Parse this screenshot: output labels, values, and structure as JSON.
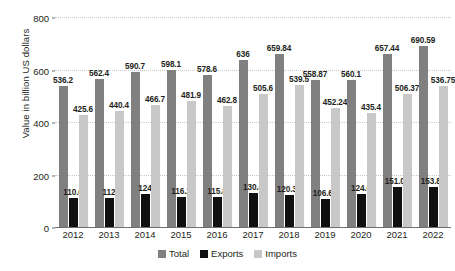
{
  "chart_data": {
    "type": "bar",
    "title": "",
    "subtitle": "",
    "xlabel": "",
    "ylabel": "Value in billion US dollars",
    "ylim": [
      0,
      800
    ],
    "yticks": [
      0,
      200,
      400,
      600,
      800
    ],
    "grid": true,
    "legend_position": "bottom",
    "categories": [
      "2012",
      "2013",
      "2014",
      "2015",
      "2016",
      "2017",
      "2018",
      "2019",
      "2020",
      "2021",
      "2022"
    ],
    "series": [
      {
        "name": "Total",
        "color": "#808080",
        "values": [
          536.2,
          562.4,
          590.7,
          598.1,
          578.6,
          636,
          659.84,
          558.87,
          560.1,
          657.44,
          690.59
        ],
        "labels": [
          "536.2",
          "562.4",
          "590.7",
          "598.1",
          "578.6",
          "636",
          "659.84",
          "558.87",
          "560.1",
          "657.44",
          "690.59"
        ]
      },
      {
        "name": "Exports",
        "color": "#101010",
        "values": [
          110.6,
          112,
          124,
          116.2,
          115.8,
          130.4,
          120.34,
          106.63,
          124.6,
          151.07,
          153.84
        ],
        "labels": [
          "110.6",
          "112",
          "124",
          "116.2",
          "115.8",
          "130.4",
          "120.34",
          "106.63",
          "124.6",
          "151.07",
          "153.84"
        ]
      },
      {
        "name": "Imports",
        "color": "#c8c8c8",
        "values": [
          425.6,
          440.4,
          466.7,
          481.9,
          462.8,
          505.6,
          539.5,
          452.24,
          435.4,
          506.37,
          536.75
        ],
        "labels": [
          "425.6",
          "440.4",
          "466.7",
          "481.9",
          "462.8",
          "505.6",
          "539.5",
          "452.24",
          "435.4",
          "506.37",
          "536.75"
        ]
      }
    ]
  }
}
